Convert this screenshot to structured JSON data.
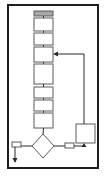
{
  "diagram": {
    "type": "flowchart",
    "colors": {
      "frame": "#1e1e1e",
      "box_stroke": "#5a5a5a",
      "header_fill": "#a8a8a8",
      "line": "#2a2a2a",
      "background": "#ffffff"
    },
    "frame": {
      "x": 8,
      "y": 5,
      "w": 90,
      "h": 163
    },
    "header_bar": {
      "x": 34,
      "y": 11,
      "w": 19,
      "h": 5
    },
    "process_boxes": [
      {
        "x": 34,
        "y": 18,
        "w": 19,
        "h": 13
      },
      {
        "x": 34,
        "y": 33,
        "w": 19,
        "h": 12
      },
      {
        "x": 34,
        "y": 47,
        "w": 19,
        "h": 15
      },
      {
        "x": 34,
        "y": 64,
        "w": 19,
        "h": 20
      },
      {
        "x": 34,
        "y": 87,
        "w": 19,
        "h": 11
      },
      {
        "x": 34,
        "y": 100,
        "w": 19,
        "h": 11
      },
      {
        "x": 34,
        "y": 113,
        "w": 19,
        "h": 15
      }
    ],
    "decision": {
      "cx": 43,
      "cy": 146,
      "rx": 11,
      "ry": 12
    },
    "side_box": {
      "x": 76,
      "y": 124,
      "w": 19,
      "h": 19
    },
    "left_connector": {
      "x": 12,
      "y": 142,
      "w": 9,
      "h": 5
    },
    "right_connector": {
      "x": 65,
      "y": 143,
      "w": 9,
      "h": 5
    }
  }
}
